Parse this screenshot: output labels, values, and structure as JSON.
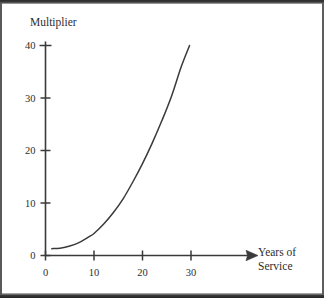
{
  "chart_data": {
    "type": "line",
    "title": "",
    "ylabel": "Multiplier",
    "xlabel": "Years of Service",
    "xlabel_line1": "Years of",
    "xlabel_line2": "Service",
    "xlim": [
      0,
      34
    ],
    "ylim": [
      0,
      41
    ],
    "xticks": [
      0,
      10,
      20,
      30
    ],
    "xtick_labels": [
      "0",
      "10",
      "20",
      "30"
    ],
    "yticks": [
      0,
      10,
      20,
      30,
      40
    ],
    "ytick_labels": [
      "0",
      "10",
      "20",
      "30",
      "40"
    ],
    "grid": false,
    "legend": null,
    "axis_arrow_x": true,
    "series": [
      {
        "name": "Multiplier",
        "color": "#3a3a3a",
        "x": [
          1.3,
          3,
          5,
          7,
          9,
          10,
          12,
          14,
          16,
          18,
          20,
          22,
          24,
          26,
          28,
          29.7
        ],
        "y": [
          1.3,
          1.4,
          1.8,
          2.5,
          3.6,
          4.2,
          6.0,
          8.2,
          10.8,
          14.0,
          17.5,
          21.4,
          25.7,
          30.4,
          36.0,
          40.0
        ]
      }
    ],
    "annotations": []
  }
}
